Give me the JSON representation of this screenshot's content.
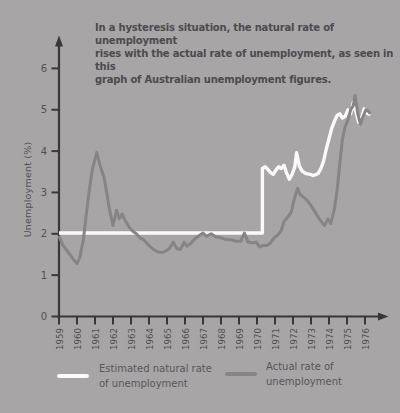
{
  "panel": {
    "bg_color": "#a8a5a7",
    "annotation": "In a hysteresis situation, the natural rate of unemployment\nrises with the actual rate of unemployment, as seen in this\ngraph of Australian unemployment figures."
  },
  "legend": {
    "items": [
      {
        "label": "Estimated natural rate\nof unemployment",
        "color": "#fafafa"
      },
      {
        "label": "Actual rate of\nunemployment",
        "color": "#878487"
      }
    ]
  },
  "chart_data": {
    "type": "line",
    "title": "In a hysteresis situation, the natural rate of unemployment rises with the actual rate of unemployment, as seen in this graph of Australian unemployment figures.",
    "xlabel": "",
    "ylabel": "Unemployment (%)",
    "x_ticks": [
      "1959",
      "1960",
      "1961",
      "1962",
      "1963",
      "1964",
      "1965",
      "1966",
      "1967",
      "1968",
      "1969",
      "1970",
      "1971",
      "1972",
      "1973",
      "1974",
      "1975",
      "1976"
    ],
    "y_ticks": [
      0,
      1,
      2,
      3,
      4,
      5,
      6
    ],
    "xlim": [
      1959,
      1977.3
    ],
    "ylim": [
      0,
      6.8
    ],
    "grid": false,
    "legend_position": "bottom",
    "colors": {
      "axis": "#39373a",
      "tick_label": "#525055"
    },
    "series": [
      {
        "name": "Estimated natural rate of unemployment",
        "color": "#fafafa",
        "points": [
          [
            1959.0,
            2.02
          ],
          [
            1970.3,
            2.02
          ],
          [
            1970.3,
            3.58
          ],
          [
            1970.45,
            3.62
          ],
          [
            1970.6,
            3.56
          ],
          [
            1970.75,
            3.48
          ],
          [
            1970.9,
            3.44
          ],
          [
            1971.05,
            3.54
          ],
          [
            1971.2,
            3.62
          ],
          [
            1971.35,
            3.58
          ],
          [
            1971.5,
            3.66
          ],
          [
            1971.65,
            3.46
          ],
          [
            1971.8,
            3.32
          ],
          [
            1971.95,
            3.44
          ],
          [
            1972.1,
            3.62
          ],
          [
            1972.2,
            3.96
          ],
          [
            1972.35,
            3.64
          ],
          [
            1972.5,
            3.52
          ],
          [
            1972.65,
            3.47
          ],
          [
            1972.8,
            3.45
          ],
          [
            1972.95,
            3.44
          ],
          [
            1973.1,
            3.41
          ],
          [
            1973.25,
            3.43
          ],
          [
            1973.4,
            3.46
          ],
          [
            1973.55,
            3.58
          ],
          [
            1973.7,
            3.76
          ],
          [
            1973.85,
            4.05
          ],
          [
            1974.0,
            4.3
          ],
          [
            1974.15,
            4.55
          ],
          [
            1974.3,
            4.72
          ],
          [
            1974.45,
            4.86
          ],
          [
            1974.6,
            4.9
          ],
          [
            1974.75,
            4.8
          ],
          [
            1974.9,
            4.84
          ],
          [
            1975.05,
            5.0
          ],
          [
            1975.2,
            4.9
          ],
          [
            1975.35,
            5.18
          ],
          [
            1975.5,
            4.95
          ],
          [
            1975.65,
            4.7
          ],
          [
            1975.8,
            4.78
          ],
          [
            1975.95,
            5.02
          ],
          [
            1976.1,
            4.92
          ],
          [
            1976.3,
            4.88
          ]
        ]
      },
      {
        "name": "Actual rate of unemployment",
        "color": "#878487",
        "points": [
          [
            1959.0,
            1.95
          ],
          [
            1959.2,
            1.74
          ],
          [
            1959.4,
            1.62
          ],
          [
            1959.6,
            1.5
          ],
          [
            1959.8,
            1.38
          ],
          [
            1960.0,
            1.28
          ],
          [
            1960.15,
            1.42
          ],
          [
            1960.35,
            1.84
          ],
          [
            1960.55,
            2.6
          ],
          [
            1960.7,
            3.1
          ],
          [
            1960.85,
            3.55
          ],
          [
            1961.1,
            3.97
          ],
          [
            1961.3,
            3.62
          ],
          [
            1961.5,
            3.37
          ],
          [
            1961.65,
            3.0
          ],
          [
            1961.8,
            2.6
          ],
          [
            1962.0,
            2.2
          ],
          [
            1962.2,
            2.57
          ],
          [
            1962.35,
            2.36
          ],
          [
            1962.5,
            2.48
          ],
          [
            1962.7,
            2.3
          ],
          [
            1962.9,
            2.16
          ],
          [
            1963.1,
            2.06
          ],
          [
            1963.3,
            2.0
          ],
          [
            1963.5,
            1.9
          ],
          [
            1963.75,
            1.84
          ],
          [
            1964.0,
            1.72
          ],
          [
            1964.25,
            1.62
          ],
          [
            1964.5,
            1.56
          ],
          [
            1964.75,
            1.55
          ],
          [
            1965.0,
            1.6
          ],
          [
            1965.15,
            1.66
          ],
          [
            1965.35,
            1.8
          ],
          [
            1965.55,
            1.64
          ],
          [
            1965.75,
            1.62
          ],
          [
            1965.95,
            1.8
          ],
          [
            1966.1,
            1.7
          ],
          [
            1966.3,
            1.76
          ],
          [
            1966.55,
            1.88
          ],
          [
            1966.8,
            1.96
          ],
          [
            1967.0,
            2.02
          ],
          [
            1967.2,
            1.94
          ],
          [
            1967.45,
            2.0
          ],
          [
            1967.7,
            1.93
          ],
          [
            1968.0,
            1.9
          ],
          [
            1968.3,
            1.86
          ],
          [
            1968.6,
            1.85
          ],
          [
            1968.85,
            1.82
          ],
          [
            1969.1,
            1.82
          ],
          [
            1969.3,
            2.02
          ],
          [
            1969.5,
            1.8
          ],
          [
            1969.75,
            1.78
          ],
          [
            1969.95,
            1.8
          ],
          [
            1970.15,
            1.68
          ],
          [
            1970.35,
            1.72
          ],
          [
            1970.55,
            1.72
          ],
          [
            1970.75,
            1.78
          ],
          [
            1970.95,
            1.9
          ],
          [
            1971.15,
            1.97
          ],
          [
            1971.35,
            2.08
          ],
          [
            1971.5,
            2.3
          ],
          [
            1971.7,
            2.4
          ],
          [
            1971.9,
            2.52
          ],
          [
            1972.05,
            2.8
          ],
          [
            1972.25,
            3.1
          ],
          [
            1972.4,
            2.95
          ],
          [
            1972.6,
            2.88
          ],
          [
            1972.8,
            2.8
          ],
          [
            1973.0,
            2.68
          ],
          [
            1973.2,
            2.55
          ],
          [
            1973.4,
            2.4
          ],
          [
            1973.6,
            2.28
          ],
          [
            1973.75,
            2.2
          ],
          [
            1973.95,
            2.36
          ],
          [
            1974.1,
            2.25
          ],
          [
            1974.3,
            2.6
          ],
          [
            1974.45,
            3.05
          ],
          [
            1974.6,
            3.7
          ],
          [
            1974.75,
            4.3
          ],
          [
            1974.9,
            4.6
          ],
          [
            1975.05,
            4.74
          ],
          [
            1975.2,
            5.0
          ],
          [
            1975.35,
            5.1
          ],
          [
            1975.45,
            5.35
          ],
          [
            1975.6,
            4.9
          ],
          [
            1975.75,
            4.65
          ],
          [
            1975.9,
            4.85
          ],
          [
            1976.05,
            5.0
          ],
          [
            1976.2,
            4.96
          ],
          [
            1976.3,
            4.9
          ]
        ]
      }
    ]
  }
}
